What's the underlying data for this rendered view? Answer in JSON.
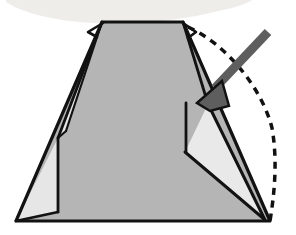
{
  "figure": {
    "kind": "origami-fold-diagram",
    "title": "Origami step: fold right flap over to the left",
    "canvas": {
      "width": 296,
      "height": 235,
      "background": "#ffffff"
    }
  },
  "colors": {
    "background": "#ffffff",
    "paper_front": "#b5b5b5",
    "paper_back": "#e9e9e9",
    "paper_back_left": "#e6e6e6",
    "outline": "#121212",
    "crease_line": "#121212",
    "dashed_line": "#111111",
    "arrow_fill": "#5e5e5e",
    "arrow_stroke": "#111111",
    "scan_smudge": "#eceae6"
  },
  "geometry": {
    "body_trapezoid": {
      "name": "main-body-trapezoid",
      "points": "102,22 183,22 270,221 16,221",
      "fill_ref": "paper_front"
    },
    "left_back_triangle": {
      "name": "left-back-triangle",
      "points": "16,221 58,138 58,212",
      "fill_ref": "paper_back_left"
    },
    "left_sliver": {
      "name": "left-crease-sliver",
      "points": "102,22 58,138 66,131",
      "fill_ref": "paper_back_left"
    },
    "right_back_triangle": {
      "name": "right-back-triangle",
      "points": "208,104 185,152 264,219",
      "fill_ref": "paper_back"
    },
    "top_edge": {
      "name": "top-edge",
      "from": [
        102,
        22
      ],
      "to": [
        183,
        22
      ]
    },
    "bottom_edge": {
      "name": "bottom-edge",
      "from": [
        16,
        221
      ],
      "to": [
        270,
        221
      ]
    },
    "left_edge": {
      "name": "left-outer-edge",
      "from": [
        102,
        22
      ],
      "to": [
        16,
        221
      ]
    },
    "right_edge": {
      "name": "right-outer-edge",
      "from": [
        183,
        22
      ],
      "to": [
        270,
        221
      ]
    },
    "left_inner_crease": {
      "name": "left-inner-crease",
      "from": [
        102,
        22
      ],
      "to": [
        58,
        138
      ]
    },
    "left_vertical_crease": {
      "name": "left-vertical-crease",
      "from": [
        58,
        138
      ],
      "to": [
        58,
        212
      ]
    },
    "left_lower_crease": {
      "name": "left-lower-crease",
      "from": [
        58,
        212
      ],
      "to": [
        16,
        221
      ]
    },
    "right_inner_crease": {
      "name": "right-inner-crease",
      "from": [
        183,
        22
      ],
      "to": [
        208,
        104
      ]
    },
    "right_vertical_crease": {
      "name": "right-vertical-crease",
      "from": [
        185,
        104
      ],
      "to": [
        185,
        152
      ]
    },
    "right_lower_crease": {
      "name": "right-lower-crease",
      "from": [
        185,
        152
      ],
      "to": [
        264,
        219
      ]
    },
    "right_diagonal_crease": {
      "name": "right-diagonal-crease",
      "from": [
        208,
        104
      ],
      "to": [
        264,
        219
      ]
    },
    "top_left_tab": {
      "name": "top-left-corner-tab",
      "points": "102,22 88,32 97,36"
    },
    "top_right_tab": {
      "name": "top-right-corner-tab",
      "points": "183,22 196,32 188,37"
    }
  },
  "dashed_guide": {
    "name": "dashed-fold-guide",
    "label": "hidden / previous edge outline",
    "path": "M 188,27 C 226,44 262,88 272,128 C 278,162 274,196 270,221",
    "dash_pattern": "7 6",
    "stroke_width": 3.5
  },
  "arrow": {
    "name": "fold-direction-arrow",
    "label": "fold this flap toward the lower-left",
    "direction": "down-left",
    "shaft": {
      "from": [
        268,
        32
      ],
      "to": [
        214,
        88
      ]
    },
    "tip": [
      197,
      103
    ],
    "head_points": "197,103 222,81 229,106 210,111",
    "width": 9
  },
  "smudge": {
    "name": "scan-smudge",
    "label": "scanner artifact",
    "path": "M 6,2 C 40,24 120,30 196,16 C 230,9 248,4 252,0 L 6,0 Z"
  }
}
